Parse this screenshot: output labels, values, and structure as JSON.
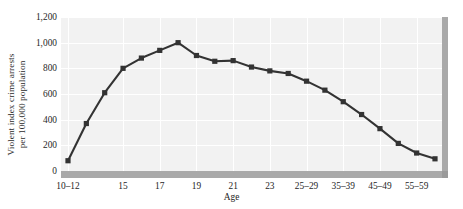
{
  "chart_data": {
    "type": "line",
    "title": "",
    "xlabel": "Age",
    "ylabel": "Violent index crime arrests per 100,000 population",
    "ylabel_line1": "Violent index crime arrests",
    "ylabel_line2": "per 100,000 population",
    "ylim": [
      0,
      1200
    ],
    "ytick_values": [
      0,
      200,
      400,
      600,
      800,
      1000,
      1200
    ],
    "ytick_labels": [
      "0",
      "200",
      "400",
      "600",
      "800",
      "1,000",
      "1,200"
    ],
    "grid": true,
    "legend": "none",
    "marker": "square",
    "line_color": "#333333",
    "marker_color": "#333333",
    "plot_bg_color": "#f2f2f2",
    "grid_color": "#ffffff",
    "axis_shadow_color": "#a9a9a9",
    "categories": [
      "10-12",
      "13",
      "14",
      "15",
      "16",
      "17",
      "18",
      "19",
      "20",
      "21",
      "22",
      "23",
      "24",
      "25-29",
      "30-34",
      "35-39",
      "40-44",
      "45-49",
      "50-54",
      "55-59",
      "60-64"
    ],
    "values": [
      80,
      370,
      610,
      800,
      880,
      940,
      1000,
      900,
      855,
      860,
      810,
      780,
      760,
      700,
      630,
      540,
      440,
      330,
      215,
      140,
      95
    ],
    "xtick_labeled": [
      "10-12",
      "15",
      "17",
      "19",
      "21",
      "23",
      "25-29",
      "35-39",
      "45-49",
      "55-59"
    ],
    "xtick_labeled_indices": [
      0,
      3,
      5,
      7,
      9,
      11,
      13,
      15,
      17,
      19
    ],
    "xgrid_indices": [
      0,
      3,
      5,
      7,
      9,
      11,
      13,
      15,
      17,
      19
    ]
  }
}
